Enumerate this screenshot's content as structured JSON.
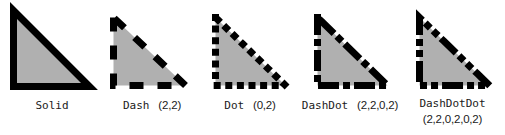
{
  "figure": {
    "background_color": "#ffffff",
    "fill_color": "#b0b0b0",
    "stroke_color": "#000000"
  },
  "samples": [
    {
      "id": "solid",
      "name": "Solid",
      "pattern": "",
      "dasharray": "",
      "linecap": "butt",
      "stroke_width": 7,
      "shape": "right-triangle",
      "size": {
        "width": 84,
        "height": 83
      },
      "offset": {
        "x": 10,
        "y": 7
      }
    },
    {
      "id": "dash",
      "name": "Dash",
      "pattern": "(2,2)",
      "dasharray": "14,14",
      "linecap": "butt",
      "stroke_width": 7,
      "shape": "right-triangle",
      "size": {
        "width": 72,
        "height": 71
      },
      "offset": {
        "x": 8,
        "y": 14
      }
    },
    {
      "id": "dot",
      "name": "Dot",
      "pattern": "(0,2)",
      "dasharray": "0.1,12",
      "linecap": "square",
      "stroke_width": 7,
      "shape": "right-triangle",
      "size": {
        "width": 72,
        "height": 71
      },
      "offset": {
        "x": 12,
        "y": 14
      }
    },
    {
      "id": "dashdot",
      "name": "DashDot",
      "pattern": "(2,2,0,2)",
      "dasharray": "14,14,0.1,14",
      "linecap": "square",
      "stroke_width": 7,
      "shape": "right-triangle",
      "size": {
        "width": 72,
        "height": 71
      },
      "offset": {
        "x": 14,
        "y": 14
      }
    },
    {
      "id": "dashdotdot",
      "name": "DashDotDot",
      "pattern": "(2,2,0,2,0,2)",
      "dasharray": "14,14,0.1,14,0.1,14",
      "linecap": "square",
      "stroke_width": 7,
      "shape": "right-triangle",
      "size": {
        "width": 72,
        "height": 71
      },
      "offset": {
        "x": 16,
        "y": 14
      }
    }
  ]
}
